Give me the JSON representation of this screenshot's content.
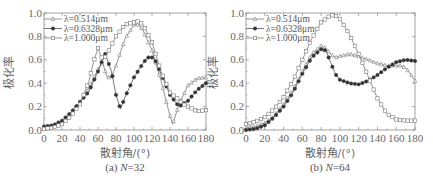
{
  "chart_data": [
    {
      "type": "line",
      "title": "(a) N=32",
      "caption_prefix": "(a) ",
      "caption_var": "N",
      "caption_value": "=32",
      "xlabel": "散射角/(°)",
      "ylabel": "极化率",
      "xlim": [
        0,
        180
      ],
      "ylim": [
        0,
        1.0
      ],
      "xticks": [
        "0",
        "20",
        "40",
        "60",
        "80",
        "100",
        "120",
        "140",
        "160",
        "180"
      ],
      "yticks": [
        "0.0",
        "0.2",
        "0.4",
        "0.6",
        "0.8",
        "1.0"
      ],
      "grid": false,
      "legend_position": "upper left",
      "series": [
        {
          "name": "λ=0.514μm",
          "marker": "open-triangle",
          "x": [
            0,
            10,
            20,
            30,
            40,
            50,
            60,
            65,
            70,
            75,
            80,
            90,
            100,
            105,
            110,
            120,
            130,
            140,
            143,
            150,
            160,
            170,
            180
          ],
          "values": [
            0.02,
            0.03,
            0.07,
            0.14,
            0.24,
            0.36,
            0.52,
            0.58,
            0.45,
            0.45,
            0.55,
            0.78,
            0.9,
            0.9,
            0.85,
            0.68,
            0.42,
            0.12,
            0.05,
            0.22,
            0.38,
            0.44,
            0.45
          ]
        },
        {
          "name": "λ=0.6328μm",
          "marker": "filled-circle",
          "x": [
            0,
            10,
            20,
            30,
            40,
            50,
            60,
            65,
            68,
            75,
            80,
            85,
            90,
            100,
            110,
            115,
            120,
            125,
            130,
            140,
            150,
            160,
            170,
            180
          ],
          "values": [
            0.03,
            0.04,
            0.08,
            0.15,
            0.24,
            0.33,
            0.5,
            0.6,
            0.65,
            0.5,
            0.3,
            0.18,
            0.28,
            0.45,
            0.57,
            0.62,
            0.62,
            0.58,
            0.48,
            0.3,
            0.2,
            0.25,
            0.34,
            0.4
          ]
        },
        {
          "name": "λ=1.000μm",
          "marker": "open-square",
          "x": [
            0,
            10,
            20,
            30,
            40,
            50,
            55,
            60,
            63,
            66,
            70,
            80,
            90,
            100,
            105,
            110,
            120,
            130,
            140,
            148,
            155,
            160,
            170,
            180
          ],
          "values": [
            0.01,
            0.02,
            0.05,
            0.12,
            0.22,
            0.42,
            0.58,
            0.7,
            0.63,
            0.6,
            0.65,
            0.8,
            0.9,
            0.92,
            0.93,
            0.9,
            0.75,
            0.5,
            0.32,
            0.27,
            0.22,
            0.2,
            0.16,
            0.17
          ]
        }
      ]
    },
    {
      "type": "line",
      "title": "(b) N=64",
      "caption_prefix": "(b) ",
      "caption_var": "N",
      "caption_value": "=64",
      "xlabel": "散射角/(°)",
      "ylabel": "极化率",
      "xlim": [
        0,
        180
      ],
      "ylim": [
        0,
        1.0
      ],
      "xticks": [
        "0",
        "20",
        "40",
        "60",
        "80",
        "100",
        "120",
        "140",
        "160",
        "180"
      ],
      "yticks": [
        "0.0",
        "0.2",
        "0.4",
        "0.6",
        "0.8",
        "1.0"
      ],
      "grid": false,
      "legend_position": "upper left",
      "series": [
        {
          "name": "λ=0.514μm",
          "marker": "open-triangle",
          "x": [
            0,
            10,
            20,
            30,
            40,
            50,
            60,
            70,
            80,
            85,
            90,
            95,
            100,
            110,
            120,
            130,
            140,
            150,
            160,
            165,
            170,
            175,
            180
          ],
          "values": [
            0.02,
            0.03,
            0.06,
            0.12,
            0.22,
            0.34,
            0.5,
            0.65,
            0.72,
            0.7,
            0.65,
            0.62,
            0.63,
            0.65,
            0.63,
            0.6,
            0.57,
            0.55,
            0.55,
            0.55,
            0.53,
            0.48,
            0.42
          ]
        },
        {
          "name": "λ=0.6328μm",
          "marker": "filled-circle",
          "x": [
            0,
            10,
            20,
            30,
            40,
            50,
            60,
            70,
            80,
            85,
            90,
            95,
            100,
            110,
            120,
            130,
            140,
            150,
            160,
            170,
            180
          ],
          "values": [
            0.0,
            0.01,
            0.04,
            0.11,
            0.2,
            0.32,
            0.48,
            0.62,
            0.69,
            0.68,
            0.58,
            0.48,
            0.43,
            0.4,
            0.39,
            0.42,
            0.47,
            0.53,
            0.58,
            0.6,
            0.59
          ]
        },
        {
          "name": "λ=1.000μm",
          "marker": "open-square",
          "x": [
            0,
            10,
            20,
            30,
            40,
            50,
            60,
            70,
            80,
            90,
            95,
            100,
            110,
            120,
            130,
            140,
            150,
            160,
            170,
            180
          ],
          "values": [
            0.05,
            0.07,
            0.11,
            0.18,
            0.28,
            0.42,
            0.6,
            0.78,
            0.92,
            0.98,
            0.98,
            0.95,
            0.82,
            0.65,
            0.46,
            0.27,
            0.14,
            0.09,
            0.08,
            0.08
          ]
        }
      ]
    }
  ],
  "colors": {
    "axis": "#8a8a8a",
    "series_line": "#7a7a7a",
    "filled_marker": "#333333",
    "text": "#666666"
  }
}
